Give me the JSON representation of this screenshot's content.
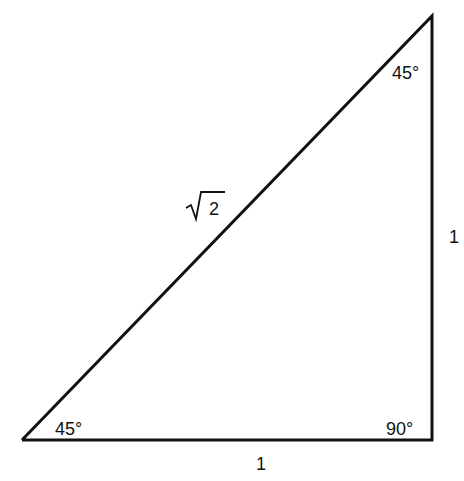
{
  "diagram": {
    "type": "right-triangle",
    "angles": {
      "bottom_left": "45°",
      "top_right": "45°",
      "bottom_right": "90°"
    },
    "sides": {
      "bottom": "1",
      "right": "1",
      "hypotenuse_radicand": "2"
    }
  }
}
